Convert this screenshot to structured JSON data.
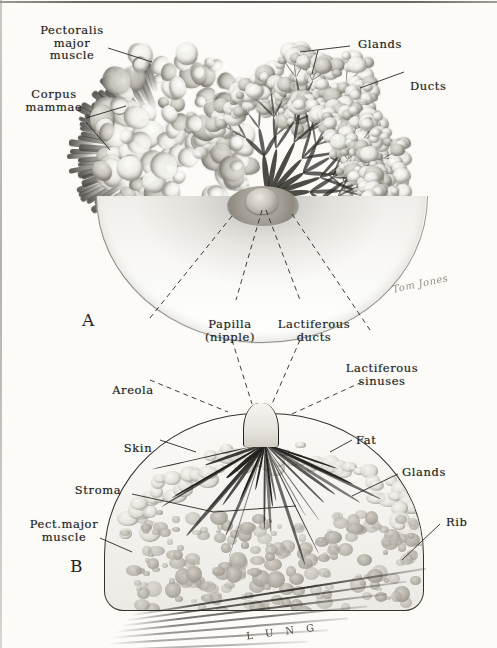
{
  "figure": {
    "panels": [
      {
        "letter": "A",
        "caption": "Anterior dissection view"
      },
      {
        "letter": "B",
        "caption": "Sagittal section"
      }
    ],
    "signature": "Tom Jones",
    "background_text": "L U N G"
  },
  "labels": {
    "pectoralis_major": "Pectoralis\nmajor\nmuscle",
    "corpus_mammae": "Corpus\nmammae",
    "glands_top": "Glands",
    "ducts": "Ducts",
    "papilla": "Papilla\n(nipple)",
    "lactiferous_ducts": "Lactiferous\nducts",
    "lactiferous_sinuses": "Lactiferous\nsinuses",
    "areola": "Areola",
    "skin": "Skin",
    "fat": "Fat",
    "stroma": "Stroma",
    "glands_lower": "Glands",
    "rib": "Rib",
    "pect_major_lower": "Pect.major\nmuscle"
  },
  "colors": {
    "ink": "#221f1c",
    "paper": "#fcfbf8",
    "tissue_light": "#efeee9",
    "tissue_mid": "#a7a39c",
    "tissue_dark": "#2e2b27",
    "leader_line": "#2b2825"
  }
}
